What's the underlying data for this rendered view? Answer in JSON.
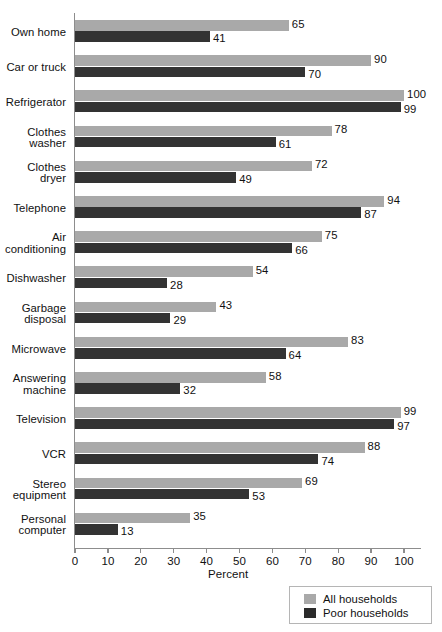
{
  "chart_data": {
    "type": "bar",
    "orientation": "horizontal",
    "title": "",
    "xlabel": "Percent",
    "ylabel": "",
    "xlim": [
      0,
      100
    ],
    "xticks": [
      0,
      10,
      20,
      30,
      40,
      50,
      60,
      70,
      80,
      90,
      100
    ],
    "grid": false,
    "legend_position": "bottom-right",
    "categories": [
      "Own home",
      "Car or truck",
      "Refrigerator",
      "Clothes washer",
      "Clothes dryer",
      "Telephone",
      "Air conditioning",
      "Dishwasher",
      "Garbage disposal",
      "Microwave",
      "Answering machine",
      "Television",
      "VCR",
      "Stereo equipment",
      "Personal computer"
    ],
    "series": [
      {
        "name": "All households",
        "color": "#a9a9a9",
        "values": [
          65,
          90,
          100,
          78,
          72,
          94,
          75,
          54,
          43,
          83,
          58,
          99,
          88,
          69,
          35
        ]
      },
      {
        "name": "Poor households",
        "color": "#333333",
        "values": [
          41,
          70,
          99,
          61,
          49,
          87,
          66,
          28,
          29,
          64,
          32,
          97,
          74,
          53,
          13
        ]
      }
    ]
  },
  "legend": {
    "items": [
      {
        "label": "All households",
        "swatch": "all"
      },
      {
        "label": "Poor households",
        "swatch": "poor"
      }
    ]
  },
  "axis": {
    "x_title": "Percent"
  }
}
